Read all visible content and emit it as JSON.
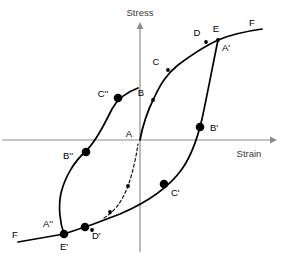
{
  "figure": {
    "type": "stress-strain-hysteresis-diagram",
    "background_color": "#ffffff",
    "axis_color": "#8c8c8c",
    "curve_color": "#000000"
  },
  "axes": {
    "y_label": "Stress",
    "x_label": "Strain",
    "origin": {
      "x": 140,
      "y": 140
    },
    "x_axis": {
      "x1": 2,
      "y1": 140,
      "x2": 272,
      "y2": 140
    },
    "y_axis": {
      "x1": 140,
      "y1": 252,
      "x2": 140,
      "y2": 26
    }
  },
  "points": [
    {
      "id": "A",
      "label": "A",
      "x": 140,
      "y": 140,
      "marker": "none",
      "label_dx": -11,
      "label_dy": -3
    },
    {
      "id": "B",
      "label": "B",
      "x": 153,
      "y": 100,
      "marker": "small",
      "label_dx": -12,
      "label_dy": -4
    },
    {
      "id": "C",
      "label": "C",
      "x": 168,
      "y": 70,
      "marker": "small",
      "label_dx": -12,
      "label_dy": -5
    },
    {
      "id": "D",
      "label": "D",
      "x": 206,
      "y": 41,
      "marker": "small",
      "label_dx": -9,
      "label_dy": -6
    },
    {
      "id": "E",
      "label": "E",
      "x": 218,
      "y": 39,
      "marker": "small",
      "label_dx": -2,
      "label_dy": -7
    },
    {
      "id": "F",
      "label": "F",
      "x": 262,
      "y": 30,
      "marker": "none",
      "label_dx": -8,
      "label_dy": -5
    },
    {
      "id": "Ap",
      "label": "A'",
      "x": 218,
      "y": 41,
      "marker": "none",
      "label_dx": 4,
      "label_dy": 10
    },
    {
      "id": "Bp",
      "label": "B'",
      "x": 200,
      "y": 127,
      "marker": "big",
      "label_dx": 7,
      "label_dy": 3
    },
    {
      "id": "Cp",
      "label": "C'",
      "x": 164,
      "y": 184,
      "marker": "big",
      "label_dx": 6,
      "label_dy": 11
    },
    {
      "id": "Dp",
      "label": "D'",
      "x": 85,
      "y": 227,
      "marker": "big",
      "label_dx": 6,
      "label_dy": 11
    },
    {
      "id": "Ep",
      "label": "E'",
      "x": 64,
      "y": 235,
      "marker": "big",
      "label_dx": -2,
      "label_dy": 14
    },
    {
      "id": "App",
      "label": "A''",
      "x": 64,
      "y": 233,
      "marker": "none",
      "label_dx": -18,
      "label_dy": -7
    },
    {
      "id": "Bpp",
      "label": "B''",
      "x": 86,
      "y": 152,
      "marker": "big",
      "label_dx": -20,
      "label_dy": 5
    },
    {
      "id": "Cpp",
      "label": "C''",
      "x": 118,
      "y": 98,
      "marker": "big",
      "label_dx": -19,
      "label_dy": -3
    },
    {
      "id": "Fp",
      "label": "F",
      "x": 18,
      "y": 239,
      "marker": "none",
      "label_dx": -14,
      "label_dy": -3
    }
  ],
  "curves": [
    {
      "name": "virgin-loading-curve",
      "style": "solid",
      "path": "M 140,140 C 143,124 148,110 154,98 C 161,83 167,74 178,65 C 190,56 203,47 218,40 C 232,34 248,31 262,29"
    },
    {
      "name": "unloading-curve",
      "style": "solid",
      "path": "M 218,40 C 213,64 207,96 202,119 C 198,136 192,155 182,169 C 170,186 148,202 120,214 C 100,222 80,229 64,234"
    },
    {
      "name": "reverse-loading-curve",
      "style": "solid",
      "path": "M 64,234 C 60,223 58,207 61,193 C 65,177 74,162 84,153 C 95,143 104,125 112,109 C 118,98 127,92 138,88"
    },
    {
      "name": "lower-branch-to-F",
      "style": "solid",
      "path": "M 64,234 C 52,236 36,239 18,242"
    },
    {
      "name": "initial-dashed-curve",
      "style": "dashed",
      "path": "M 104,218 C 114,212 122,202 128,186 C 133,172 136,157 138,144"
    }
  ],
  "dashed_curve_points": [
    {
      "x": 110,
      "y": 212,
      "marker": "small"
    },
    {
      "x": 128,
      "y": 186,
      "marker": "small"
    }
  ],
  "extra_small_points": [
    {
      "x": 92,
      "y": 230,
      "marker": "small"
    }
  ]
}
